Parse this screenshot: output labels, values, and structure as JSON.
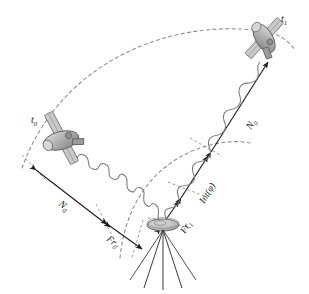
{
  "figure": {
    "background_color": "#ffffff",
    "ink_color": "#1a1a1a",
    "dashed_color": "#8a8a8a",
    "wave_color": "#7a7a7a",
    "satellite_body_color": "#b8b8b8",
    "satellite_shade_color": "#8d8d8d"
  },
  "labels": {
    "epoch_0": "t",
    "epoch_0_sub": "0",
    "epoch_1": "t",
    "epoch_1_sub": "1",
    "ambiguity_left": "N",
    "ambiguity_left_sub": "0",
    "ambiguity_right": "N",
    "ambiguity_right_sub": "0",
    "fractional_0": "Fr",
    "fractional_0_sub": "0",
    "fractional_1": "Fr",
    "fractional_1_sub": "1",
    "integer_phase": "Int(φ)"
  },
  "elements": {
    "satellite_t0": "satellite-at-epoch-t0",
    "satellite_t1": "satellite-at-epoch-t1",
    "orbit_arc_upper": "dashed-orbit-arc-upper",
    "orbit_arc_lower": "dashed-range-arc-lower",
    "signal_wave_left": "carrier-wave-from-t0",
    "signal_wave_right": "carrier-wave-from-t1",
    "range_line_left": "range-measurement-line-t0",
    "range_line_right": "range-measurement-line-t1",
    "ground_antenna": "ground-receiver-antenna",
    "tripod": "antenna-tripod"
  }
}
